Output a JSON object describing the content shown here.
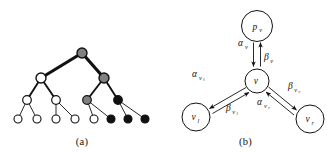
{
  "figure": {
    "panels": [
      {
        "id": "a",
        "caption": "(a)",
        "type": "binary-tree",
        "description": "Binary tree with nodes shaded white, gray and black; thick edges mark a highlighted path",
        "colors": {
          "white": "#ffffff",
          "gray": "#808080",
          "black": "#111111",
          "stroke": "#111111"
        },
        "nodes": [
          {
            "id": "n0",
            "level": 0,
            "cx": 82,
            "cy": 53,
            "r": 5.0,
            "fill": "gray"
          },
          {
            "id": "n1",
            "level": 1,
            "cx": 41,
            "cy": 78,
            "r": 5.0,
            "fill": "white"
          },
          {
            "id": "n2",
            "level": 1,
            "cx": 104,
            "cy": 78,
            "r": 5.0,
            "fill": "gray"
          },
          {
            "id": "n3",
            "level": 2,
            "cx": 27,
            "cy": 100,
            "r": 4.3,
            "fill": "white"
          },
          {
            "id": "n4",
            "level": 2,
            "cx": 56,
            "cy": 100,
            "r": 4.3,
            "fill": "white"
          },
          {
            "id": "n5",
            "level": 2,
            "cx": 87,
            "cy": 100,
            "r": 4.3,
            "fill": "gray"
          },
          {
            "id": "n6",
            "level": 2,
            "cx": 118,
            "cy": 100,
            "r": 4.3,
            "fill": "black"
          },
          {
            "id": "n7",
            "level": 3,
            "cx": 18,
            "cy": 119,
            "r": 4.0,
            "fill": "white"
          },
          {
            "id": "n8",
            "level": 3,
            "cx": 37,
            "cy": 119,
            "r": 4.0,
            "fill": "white"
          },
          {
            "id": "n9",
            "level": 3,
            "cx": 56,
            "cy": 119,
            "r": 4.0,
            "fill": "white"
          },
          {
            "id": "n10",
            "level": 3,
            "cx": 75,
            "cy": 119,
            "r": 4.0,
            "fill": "white"
          },
          {
            "id": "n11",
            "level": 3,
            "cx": 94,
            "cy": 119,
            "r": 4.0,
            "fill": "white"
          },
          {
            "id": "n12",
            "level": 3,
            "cx": 111,
            "cy": 119,
            "r": 4.0,
            "fill": "black"
          },
          {
            "id": "n13",
            "level": 3,
            "cx": 128,
            "cy": 119,
            "r": 4.0,
            "fill": "black"
          },
          {
            "id": "n14",
            "level": 3,
            "cx": 145,
            "cy": 119,
            "r": 4.0,
            "fill": "black"
          }
        ],
        "edges": [
          {
            "from": "n0",
            "to": "n1",
            "weight": "thick"
          },
          {
            "from": "n0",
            "to": "n2",
            "weight": "thick"
          },
          {
            "from": "n1",
            "to": "n3",
            "weight": "medium"
          },
          {
            "from": "n1",
            "to": "n4",
            "weight": "medium"
          },
          {
            "from": "n2",
            "to": "n5",
            "weight": "medium"
          },
          {
            "from": "n2",
            "to": "n6",
            "weight": "medium"
          },
          {
            "from": "n3",
            "to": "n7",
            "weight": "thin"
          },
          {
            "from": "n3",
            "to": "n8",
            "weight": "thin"
          },
          {
            "from": "n4",
            "to": "n9",
            "weight": "thin"
          },
          {
            "from": "n4",
            "to": "n10",
            "weight": "thin"
          },
          {
            "from": "n5",
            "to": "n11",
            "weight": "thin"
          },
          {
            "from": "n5",
            "to": "n12",
            "weight": "thin"
          },
          {
            "from": "n6",
            "to": "n13",
            "weight": "thin"
          },
          {
            "from": "n6",
            "to": "n14",
            "weight": "thin"
          }
        ]
      },
      {
        "id": "b",
        "caption": "(b)",
        "type": "message-passing",
        "description": "Node v exchanging alpha and beta messages with parent p_v and children v_l and v_r",
        "nodes": [
          {
            "id": "pv",
            "cx": 93,
            "cy": 26,
            "r": 15.5,
            "label": "p",
            "sub": "v"
          },
          {
            "id": "v",
            "cx": 93,
            "cy": 81,
            "r": 12.0,
            "label": "v",
            "sub": ""
          },
          {
            "id": "vl",
            "cx": 32,
            "cy": 117,
            "r": 14.0,
            "label": "v",
            "sub": "l"
          },
          {
            "id": "vr",
            "cx": 146,
            "cy": 119,
            "r": 14.0,
            "label": "v",
            "sub": "r"
          }
        ],
        "messages": [
          {
            "id": "alpha-v",
            "label": "α",
            "sub": "v",
            "direction": "down",
            "from": "pv",
            "to": "v",
            "lx": 74,
            "ly": 46,
            "sub_dx": 7.0,
            "sub_dy": 2.6
          },
          {
            "id": "beta-v",
            "label": "β",
            "sub": "v",
            "direction": "up",
            "from": "v",
            "to": "pv",
            "lx": 100,
            "ly": 60,
            "sub_dx": 6.2,
            "sub_dy": 2.6
          },
          {
            "id": "alpha-vl",
            "label": "α",
            "sub": "v",
            "sub2": "l",
            "direction": "down-left",
            "from": "v",
            "to": "vl",
            "lx": 28,
            "ly": 77,
            "sub_dx": 7.0,
            "sub_dy": 2.6
          },
          {
            "id": "beta-vl",
            "label": "β",
            "sub": "v",
            "sub2": "l",
            "direction": "up-right",
            "from": "vl",
            "to": "v",
            "lx": 62,
            "ly": 111,
            "sub_dx": 6.2,
            "sub_dy": 2.6
          },
          {
            "id": "beta-vr",
            "label": "β",
            "sub": "v",
            "sub2": "r",
            "direction": "down-right",
            "from": "v",
            "to": "vr",
            "lx": 124,
            "ly": 89,
            "sub_dx": 6.2,
            "sub_dy": 2.6
          },
          {
            "id": "alpha-vr",
            "label": "α",
            "sub": "v",
            "sub2": "r",
            "direction": "up-left",
            "from": "vr",
            "to": "v",
            "lx": 93,
            "ly": 105,
            "sub_dx": 7.0,
            "sub_dy": 2.6
          }
        ]
      }
    ]
  }
}
